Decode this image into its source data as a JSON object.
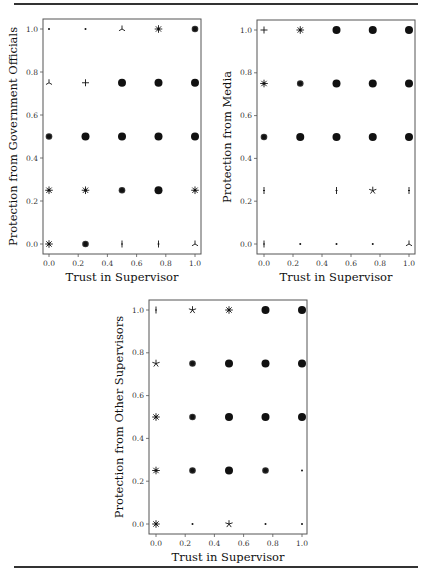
{
  "chart_data": [
    {
      "type": "scatter",
      "title": "",
      "xlabel": "Trust in Supervisor",
      "ylabel": "Protection from Government Officials",
      "xlim": [
        0,
        1
      ],
      "ylim": [
        0,
        1
      ],
      "xticks": [
        "0.0",
        "0.2",
        "0.4",
        "0.6",
        "0.8",
        "1.0"
      ],
      "yticks": [
        "0.0",
        "0.2",
        "0.4",
        "0.6",
        "0.8",
        "1.0"
      ],
      "grid": false,
      "points": [
        {
          "x": 0.0,
          "y": 1.0,
          "marker": "dot"
        },
        {
          "x": 0.25,
          "y": 1.0,
          "marker": "dot"
        },
        {
          "x": 0.5,
          "y": 1.0,
          "marker": "tri"
        },
        {
          "x": 0.75,
          "y": 1.0,
          "marker": "asterisk"
        },
        {
          "x": 1.0,
          "y": 1.0,
          "marker": "circle-sm"
        },
        {
          "x": 0.0,
          "y": 0.75,
          "marker": "tri"
        },
        {
          "x": 0.25,
          "y": 0.75,
          "marker": "plus"
        },
        {
          "x": 0.5,
          "y": 0.75,
          "marker": "circle"
        },
        {
          "x": 0.75,
          "y": 0.75,
          "marker": "circle"
        },
        {
          "x": 1.0,
          "y": 0.75,
          "marker": "circle"
        },
        {
          "x": 0.0,
          "y": 0.5,
          "marker": "circle-sm"
        },
        {
          "x": 0.25,
          "y": 0.5,
          "marker": "circle"
        },
        {
          "x": 0.5,
          "y": 0.5,
          "marker": "circle"
        },
        {
          "x": 0.75,
          "y": 0.5,
          "marker": "circle"
        },
        {
          "x": 1.0,
          "y": 0.5,
          "marker": "circle"
        },
        {
          "x": 0.0,
          "y": 0.25,
          "marker": "asterisk"
        },
        {
          "x": 0.25,
          "y": 0.25,
          "marker": "asterisk"
        },
        {
          "x": 0.5,
          "y": 0.25,
          "marker": "circle-sm"
        },
        {
          "x": 0.75,
          "y": 0.25,
          "marker": "circle"
        },
        {
          "x": 1.0,
          "y": 0.25,
          "marker": "asterisk"
        },
        {
          "x": 0.0,
          "y": 0.0,
          "marker": "asterisk"
        },
        {
          "x": 0.25,
          "y": 0.0,
          "marker": "circle-sm"
        },
        {
          "x": 0.5,
          "y": 0.0,
          "marker": "vline"
        },
        {
          "x": 0.75,
          "y": 0.0,
          "marker": "vline"
        },
        {
          "x": 1.0,
          "y": 0.0,
          "marker": "tri"
        }
      ]
    },
    {
      "type": "scatter",
      "title": "",
      "xlabel": "Trust in Supervisor",
      "ylabel": "Protection from Media",
      "xlim": [
        0,
        1
      ],
      "ylim": [
        0,
        1
      ],
      "xticks": [
        "0.0",
        "0.2",
        "0.4",
        "0.6",
        "0.8",
        "1.0"
      ],
      "yticks": [
        "0.0",
        "0.2",
        "0.4",
        "0.6",
        "0.8",
        "1.0"
      ],
      "grid": false,
      "points": [
        {
          "x": 0.0,
          "y": 1.0,
          "marker": "plus"
        },
        {
          "x": 0.25,
          "y": 1.0,
          "marker": "asterisk"
        },
        {
          "x": 0.5,
          "y": 1.0,
          "marker": "circle"
        },
        {
          "x": 0.75,
          "y": 1.0,
          "marker": "circle"
        },
        {
          "x": 1.0,
          "y": 1.0,
          "marker": "circle"
        },
        {
          "x": 0.0,
          "y": 0.75,
          "marker": "asterisk"
        },
        {
          "x": 0.25,
          "y": 0.75,
          "marker": "circle-sm"
        },
        {
          "x": 0.5,
          "y": 0.75,
          "marker": "circle"
        },
        {
          "x": 0.75,
          "y": 0.75,
          "marker": "circle"
        },
        {
          "x": 1.0,
          "y": 0.75,
          "marker": "circle"
        },
        {
          "x": 0.0,
          "y": 0.5,
          "marker": "circle-sm"
        },
        {
          "x": 0.25,
          "y": 0.5,
          "marker": "circle"
        },
        {
          "x": 0.5,
          "y": 0.5,
          "marker": "circle"
        },
        {
          "x": 0.75,
          "y": 0.5,
          "marker": "circle"
        },
        {
          "x": 1.0,
          "y": 0.5,
          "marker": "circle"
        },
        {
          "x": 0.0,
          "y": 0.25,
          "marker": "vline"
        },
        {
          "x": 0.5,
          "y": 0.25,
          "marker": "vline"
        },
        {
          "x": 0.75,
          "y": 0.25,
          "marker": "star"
        },
        {
          "x": 1.0,
          "y": 0.25,
          "marker": "vline"
        },
        {
          "x": 0.0,
          "y": 0.0,
          "marker": "vline"
        },
        {
          "x": 0.25,
          "y": 0.0,
          "marker": "dot"
        },
        {
          "x": 0.5,
          "y": 0.0,
          "marker": "dot"
        },
        {
          "x": 0.75,
          "y": 0.0,
          "marker": "dot"
        },
        {
          "x": 1.0,
          "y": 0.0,
          "marker": "tri"
        }
      ]
    },
    {
      "type": "scatter",
      "title": "",
      "xlabel": "Trust in Supervisor",
      "ylabel": "Protection from Other Supervisors",
      "xlim": [
        0,
        1
      ],
      "ylim": [
        0,
        1
      ],
      "xticks": [
        "0.0",
        "0.2",
        "0.4",
        "0.6",
        "0.8",
        "1.0"
      ],
      "yticks": [
        "0.0",
        "0.2",
        "0.4",
        "0.6",
        "0.8",
        "1.0"
      ],
      "grid": false,
      "points": [
        {
          "x": 0.0,
          "y": 1.0,
          "marker": "vline"
        },
        {
          "x": 0.25,
          "y": 1.0,
          "marker": "star"
        },
        {
          "x": 0.5,
          "y": 1.0,
          "marker": "asterisk"
        },
        {
          "x": 0.75,
          "y": 1.0,
          "marker": "circle"
        },
        {
          "x": 1.0,
          "y": 1.0,
          "marker": "circle"
        },
        {
          "x": 0.0,
          "y": 0.75,
          "marker": "star"
        },
        {
          "x": 0.25,
          "y": 0.75,
          "marker": "circle-sm"
        },
        {
          "x": 0.5,
          "y": 0.75,
          "marker": "circle"
        },
        {
          "x": 0.75,
          "y": 0.75,
          "marker": "circle"
        },
        {
          "x": 1.0,
          "y": 0.75,
          "marker": "circle"
        },
        {
          "x": 0.0,
          "y": 0.5,
          "marker": "asterisk"
        },
        {
          "x": 0.25,
          "y": 0.5,
          "marker": "circle-sm"
        },
        {
          "x": 0.5,
          "y": 0.5,
          "marker": "circle"
        },
        {
          "x": 0.75,
          "y": 0.5,
          "marker": "circle"
        },
        {
          "x": 1.0,
          "y": 0.5,
          "marker": "circle"
        },
        {
          "x": 0.0,
          "y": 0.25,
          "marker": "asterisk"
        },
        {
          "x": 0.25,
          "y": 0.25,
          "marker": "circle-sm"
        },
        {
          "x": 0.5,
          "y": 0.25,
          "marker": "circle"
        },
        {
          "x": 0.75,
          "y": 0.25,
          "marker": "circle-sm"
        },
        {
          "x": 1.0,
          "y": 0.25,
          "marker": "dot"
        },
        {
          "x": 0.0,
          "y": 0.0,
          "marker": "asterisk"
        },
        {
          "x": 0.25,
          "y": 0.0,
          "marker": "dot"
        },
        {
          "x": 0.5,
          "y": 0.0,
          "marker": "star"
        },
        {
          "x": 0.75,
          "y": 0.0,
          "marker": "dot"
        },
        {
          "x": 1.0,
          "y": 0.0,
          "marker": "dot"
        }
      ]
    }
  ],
  "layout": {
    "plots": [
      {
        "box": [
          43,
          19,
          201,
          254
        ],
        "x0": 49,
        "x1": 195,
        "y0": 244,
        "y1": 29
      },
      {
        "box": [
          257,
          20,
          415,
          254
        ],
        "x0": 264,
        "x1": 409,
        "y0": 244,
        "y1": 30
      },
      {
        "box": [
          149,
          300,
          307,
          534
        ],
        "x0": 156,
        "x1": 302,
        "y0": 524,
        "y1": 310
      }
    ]
  }
}
